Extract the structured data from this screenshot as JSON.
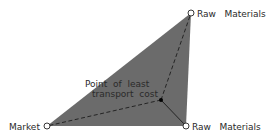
{
  "diagram": {
    "fill_color": "#6b6b6b",
    "line_color": "#111111",
    "labels": {
      "top_right": "Raw   Materials",
      "bottom_right": "Raw   Materials",
      "market": "Market",
      "point_line1": "Point  of  least",
      "point_line2": "transport  cost"
    },
    "nodes": [
      {
        "name": "raw-materials-top",
        "x": 191,
        "y": 13
      },
      {
        "name": "market",
        "x": 47,
        "y": 126
      },
      {
        "name": "raw-materials-bottom",
        "x": 186,
        "y": 126
      },
      {
        "name": "point-of-least-transport-cost",
        "x": 161,
        "y": 100
      }
    ]
  }
}
